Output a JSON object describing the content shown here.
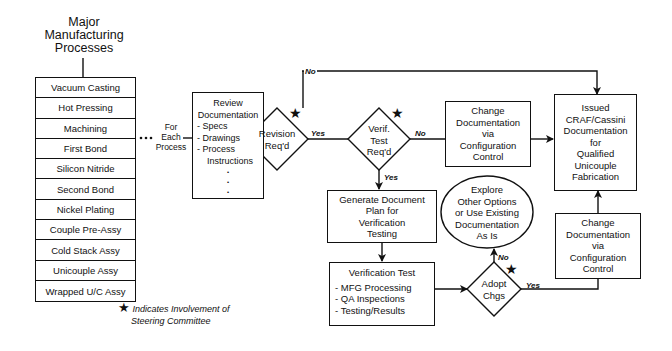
{
  "title": [
    "Major",
    "Manufacturing",
    "Processes"
  ],
  "processes": [
    "Vacuum Casting",
    "Hot Pressing",
    "Machining",
    "First Bond",
    "Silicon Nitride",
    "Second Bond",
    "Nickel Plating",
    "Couple Pre-Assy",
    "Cold Stack Assy",
    "Unicouple Assy",
    "Wrapped U/C Assy"
  ],
  "for_each": [
    "For",
    "Each",
    "Process"
  ],
  "review": {
    "title": [
      "Review",
      "Documentation"
    ],
    "items": [
      "- Specs",
      "- Drawings",
      "- Process",
      "Instructions"
    ],
    "dots": [
      "•",
      "•",
      "•"
    ]
  },
  "revision_decision": [
    "Revision",
    "Req'd"
  ],
  "verif_decision": [
    "Verif.",
    "Test",
    "Req'd"
  ],
  "change_doc_top": [
    "Change",
    "Documentation",
    "via",
    "Configuration",
    "Control"
  ],
  "issued": [
    "Issued",
    "CRAF/Cassini",
    "Documentation",
    "for",
    "Qualified",
    "Unicouple",
    "Fabrication"
  ],
  "generate_plan": [
    "Generate Document",
    "Plan for",
    "Verification",
    "Testing"
  ],
  "verification_test": {
    "title": "Verification Test",
    "items": [
      "- MFG Processing",
      "- QA Inspections",
      "- Testing/Results"
    ]
  },
  "adopt_decision": [
    "Adopt",
    "Chgs"
  ],
  "explore": [
    "Explore",
    "Other Options",
    "or Use Existing",
    "Documentation",
    "As Is"
  ],
  "change_doc_bottom": [
    "Change",
    "Documentation",
    "via",
    "Configuration",
    "Control"
  ],
  "edge_labels": {
    "revision_no": "No",
    "revision_yes": "Yes",
    "verif_no": "No",
    "verif_yes": "Yes",
    "adopt_no": "No",
    "adopt_yes": "Yes"
  },
  "legend": {
    "star": "★",
    "line1": "Indicates Involvement of",
    "line2": "Steering Committee"
  }
}
